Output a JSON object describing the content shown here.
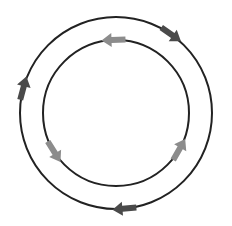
{
  "diagram": {
    "type": "concentric-cycle",
    "background": "#ffffff",
    "center": {
      "x": 116,
      "y": 113
    },
    "outer_ring": {
      "radius": 96,
      "stroke": "#222222",
      "stroke_width": 2,
      "direction": "clockwise",
      "arrow_color": "#4a4a4a",
      "arrows": [
        {
          "angle_deg": -55,
          "icon": "arrow-clockwise"
        },
        {
          "angle_deg": 195,
          "icon": "arrow-clockwise"
        },
        {
          "angle_deg": 85,
          "icon": "arrow-clockwise"
        }
      ]
    },
    "inner_ring": {
      "radius": 73,
      "stroke": "#222222",
      "stroke_width": 2,
      "direction": "counter-clockwise",
      "arrow_color": "#8c8c8c",
      "arrows": [
        {
          "angle_deg": -92,
          "icon": "arrow-counter-clockwise"
        },
        {
          "angle_deg": 148,
          "icon": "arrow-counter-clockwise"
        },
        {
          "angle_deg": 30,
          "icon": "arrow-counter-clockwise"
        }
      ]
    }
  }
}
